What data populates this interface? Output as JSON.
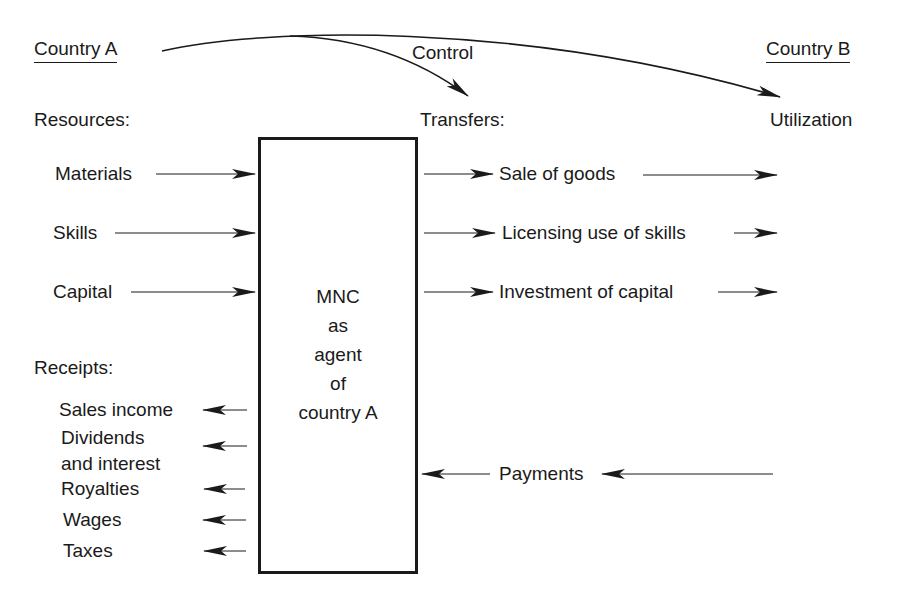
{
  "header": {
    "country_a": "Country A",
    "country_b": "Country B",
    "control": "Control"
  },
  "sections": {
    "resources": "Resources:",
    "transfers": "Transfers:",
    "utilization": "Utilization",
    "receipts": "Receipts:"
  },
  "resources": [
    "Materials",
    "Skills",
    "Capital"
  ],
  "transfers": [
    "Sale of goods",
    "Licensing use of skills",
    "Investment of capital"
  ],
  "receipts": [
    "Sales income",
    "Dividends",
    "and interest",
    "Royalties",
    "Wages",
    "Taxes"
  ],
  "center_box": {
    "lines": [
      "MNC",
      "as",
      "agent",
      "of",
      "country A"
    ]
  },
  "payments": "Payments"
}
